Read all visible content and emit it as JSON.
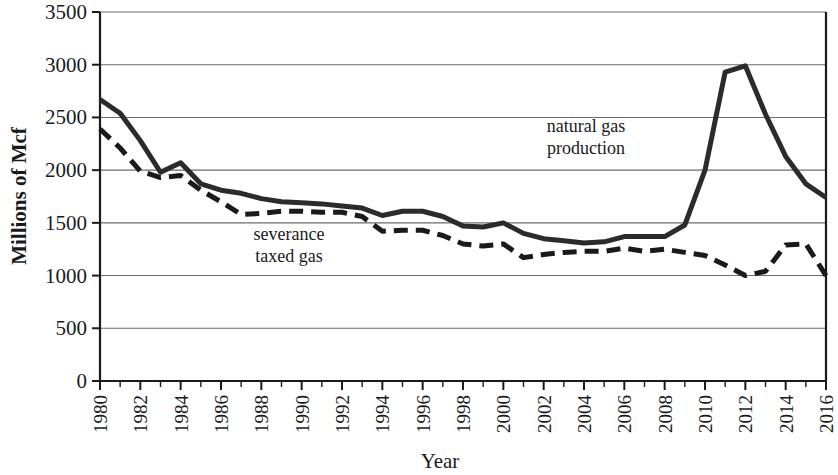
{
  "chart_data": {
    "type": "line",
    "title": "",
    "xlabel": "Year",
    "ylabel": "Millions of Mcf",
    "xlim": [
      1980,
      2016
    ],
    "ylim": [
      0,
      3500
    ],
    "y_ticks": [
      0,
      500,
      1000,
      1500,
      2000,
      2500,
      3000,
      3500
    ],
    "x_ticks": [
      1980,
      1982,
      1984,
      1986,
      1988,
      1990,
      1992,
      1994,
      1996,
      1998,
      2000,
      2002,
      2004,
      2006,
      2008,
      2010,
      2012,
      2014,
      2016
    ],
    "x_tick_labels": [
      "1980",
      "1982",
      "1984",
      "1986",
      "1988",
      "1990",
      "1992",
      "1994",
      "1996",
      "1998",
      "2000",
      "2002",
      "2004",
      "2006",
      "2008",
      "2010",
      "2012",
      "2014",
      "2016"
    ],
    "x_tick_rotation": 90,
    "grid": "horizontal",
    "legend_position": "inline-annotation",
    "x": [
      1980,
      1981,
      1982,
      1983,
      1984,
      1985,
      1986,
      1987,
      1988,
      1989,
      1990,
      1991,
      1992,
      1993,
      1994,
      1995,
      1996,
      1997,
      1998,
      1999,
      2000,
      2001,
      2002,
      2003,
      2004,
      2005,
      2006,
      2007,
      2008,
      2009,
      2010,
      2011,
      2012,
      2013,
      2014,
      2015,
      2016
    ],
    "series": [
      {
        "name": "natural gas production",
        "style": "solid",
        "color": "#2b2b2b",
        "values": [
          2670,
          2540,
          2280,
          1980,
          2070,
          1870,
          1810,
          1780,
          1730,
          1700,
          1690,
          1680,
          1660,
          1640,
          1570,
          1610,
          1610,
          1560,
          1470,
          1460,
          1500,
          1400,
          1350,
          1330,
          1310,
          1320,
          1370,
          1370,
          1370,
          1480,
          2000,
          2930,
          2990,
          2530,
          2130,
          1870,
          1740
        ]
      },
      {
        "name": "severance taxed gas",
        "style": "dashed",
        "color": "#1a1a1a",
        "values": [
          2390,
          2210,
          1990,
          1930,
          1950,
          1810,
          1700,
          1580,
          1590,
          1610,
          1610,
          1600,
          1600,
          1560,
          1420,
          1430,
          1430,
          1380,
          1300,
          1280,
          1300,
          1170,
          1200,
          1220,
          1230,
          1230,
          1260,
          1230,
          1250,
          1220,
          1190,
          1100,
          1000,
          1040,
          1290,
          1300,
          1000
        ]
      }
    ],
    "annotations": [
      {
        "id": "natural-gas-production-label",
        "text_lines": [
          "natural gas",
          "production"
        ],
        "x_px": 586,
        "y_px": 132
      },
      {
        "id": "severance-taxed-gas-label",
        "text_lines": [
          "severance",
          "taxed gas"
        ],
        "x_px": 289,
        "y_px": 240
      }
    ]
  },
  "axes": {
    "ylabel": "Millions of Mcf",
    "xlabel": "Year"
  }
}
